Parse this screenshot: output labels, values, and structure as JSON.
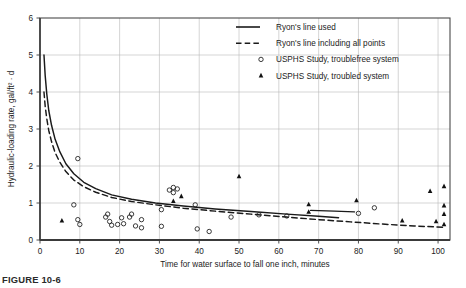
{
  "figure": {
    "caption": "FIGURE 10-6",
    "background_color": "#ffffff"
  },
  "chart_data": {
    "type": "scatter",
    "title": "",
    "xlabel": "Time for water surface to fall one inch, minutes",
    "ylabel": "Hydraulic-loading rate, gal/ft² · d",
    "xlim": [
      0,
      103
    ],
    "ylim": [
      0,
      6
    ],
    "xticks": [
      0,
      10,
      20,
      30,
      40,
      50,
      60,
      70,
      80,
      90,
      100
    ],
    "yticks": [
      0,
      1,
      2,
      3,
      4,
      5,
      6
    ],
    "grid": true,
    "grid_color": "#b9b9b9",
    "frame_color": "#4a4a4a",
    "legend_position": "top-right",
    "legend": [
      {
        "label": "Ryon's line used",
        "marker": "solid-line"
      },
      {
        "label": "Ryon's line including all points",
        "marker": "dashed-line"
      },
      {
        "label": "USPHS Study, troublefree system",
        "marker": "open-circle"
      },
      {
        "label": "USPHS Study, troubled system",
        "marker": "filled-triangle"
      }
    ],
    "series": [
      {
        "name": "Ryon's line used",
        "type": "line",
        "style": "solid",
        "color": "#1a1a1a",
        "points": [
          [
            1.0,
            5.0
          ],
          [
            1.3,
            4.45
          ],
          [
            1.7,
            3.95
          ],
          [
            2.2,
            3.5
          ],
          [
            2.9,
            3.1
          ],
          [
            3.8,
            2.72
          ],
          [
            5.0,
            2.38
          ],
          [
            6.5,
            2.06
          ],
          [
            8.5,
            1.79
          ],
          [
            11.0,
            1.56
          ],
          [
            14.0,
            1.39
          ],
          [
            18.0,
            1.22
          ],
          [
            23.0,
            1.1
          ],
          [
            29.0,
            1.0
          ],
          [
            36.0,
            0.92
          ],
          [
            44.0,
            0.84
          ],
          [
            53.0,
            0.77
          ],
          [
            62.0,
            0.7
          ],
          [
            70.0,
            0.64
          ],
          [
            75.0,
            0.6
          ]
        ]
      },
      {
        "name": "Ryon's line including all points",
        "type": "line",
        "style": "dashed",
        "color": "#1a1a1a",
        "points": [
          [
            1.0,
            4.0
          ],
          [
            1.3,
            3.62
          ],
          [
            1.7,
            3.28
          ],
          [
            2.2,
            2.96
          ],
          [
            2.9,
            2.66
          ],
          [
            3.8,
            2.36
          ],
          [
            5.0,
            2.1
          ],
          [
            6.5,
            1.85
          ],
          [
            8.5,
            1.62
          ],
          [
            11.0,
            1.44
          ],
          [
            14.0,
            1.29
          ],
          [
            18.0,
            1.15
          ],
          [
            23.0,
            1.04
          ],
          [
            29.0,
            0.95
          ],
          [
            36.0,
            0.86
          ],
          [
            44.0,
            0.78
          ],
          [
            53.0,
            0.7
          ],
          [
            62.0,
            0.62
          ],
          [
            70.0,
            0.55
          ],
          [
            78.0,
            0.49
          ],
          [
            86.0,
            0.43
          ],
          [
            94.0,
            0.38
          ],
          [
            102.0,
            0.34
          ]
        ]
      },
      {
        "name": "Ryon's line used extension",
        "type": "line",
        "style": "solid",
        "color": "#1a1a1a",
        "points": [
          [
            68.0,
            0.8
          ],
          [
            74.0,
            0.78
          ],
          [
            79.0,
            0.76
          ]
        ]
      },
      {
        "name": "USPHS Study, troublefree system",
        "type": "scatter",
        "marker": "open-circle",
        "color": "#1a1a1a",
        "points": [
          [
            8.5,
            0.95
          ],
          [
            9.5,
            2.2
          ],
          [
            9.5,
            0.55
          ],
          [
            10.0,
            0.42
          ],
          [
            16.5,
            0.62
          ],
          [
            17.0,
            0.7
          ],
          [
            17.5,
            0.5
          ],
          [
            18.0,
            0.4
          ],
          [
            19.5,
            0.42
          ],
          [
            20.5,
            0.6
          ],
          [
            21.0,
            0.44
          ],
          [
            22.5,
            0.62
          ],
          [
            23.0,
            0.7
          ],
          [
            24.0,
            0.38
          ],
          [
            25.5,
            0.55
          ],
          [
            25.5,
            0.33
          ],
          [
            30.5,
            0.82
          ],
          [
            30.5,
            0.37
          ],
          [
            32.5,
            1.35
          ],
          [
            33.5,
            1.42
          ],
          [
            33.5,
            1.28
          ],
          [
            34.5,
            1.38
          ],
          [
            39.0,
            0.95
          ],
          [
            39.5,
            0.3
          ],
          [
            42.5,
            0.23
          ],
          [
            48.0,
            0.62
          ],
          [
            55.0,
            0.68
          ],
          [
            62.0,
            0.65
          ],
          [
            80.0,
            0.72
          ],
          [
            84.0,
            0.87
          ]
        ]
      },
      {
        "name": "USPHS Study, troubled system",
        "type": "scatter",
        "marker": "filled-triangle",
        "color": "#111111",
        "points": [
          [
            5.5,
            0.52
          ],
          [
            33.5,
            1.05
          ],
          [
            35.5,
            1.18
          ],
          [
            50.0,
            1.72
          ],
          [
            67.5,
            0.96
          ],
          [
            67.5,
            0.76
          ],
          [
            79.5,
            1.07
          ],
          [
            91.0,
            0.52
          ],
          [
            98.0,
            1.32
          ],
          [
            99.5,
            0.5
          ],
          [
            101.5,
            1.45
          ],
          [
            101.5,
            0.93
          ],
          [
            101.5,
            0.7
          ],
          [
            101.5,
            0.42
          ]
        ]
      }
    ]
  }
}
